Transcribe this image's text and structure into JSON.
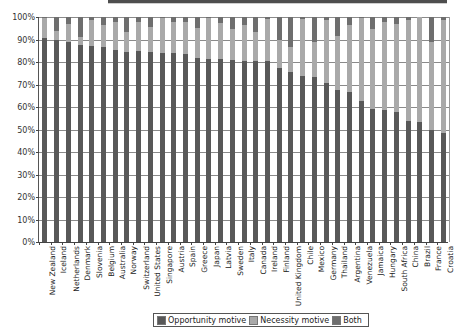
{
  "chart_data": {
    "type": "bar",
    "stacked": true,
    "title": "",
    "xlabel": "",
    "ylabel": "",
    "ylim": [
      0,
      100
    ],
    "y_ticks": [
      "0%",
      "10%",
      "20%",
      "30%",
      "40%",
      "50%",
      "60%",
      "70%",
      "80%",
      "90%",
      "100%"
    ],
    "grid": true,
    "legend_position": "bottom",
    "categories": [
      "New Zealand",
      "Iceland",
      "Netherlands",
      "Denmark",
      "Slovenia",
      "Belgium",
      "Australia",
      "Norway",
      "Switzerland",
      "United States",
      "Singapore",
      "Austria",
      "Spain",
      "Greece",
      "Japan",
      "Latvia",
      "Sweden",
      "Italy",
      "Canada",
      "Ireland",
      "Finland",
      "United Kingdom",
      "Chile",
      "Mexico",
      "Germany",
      "Thailand",
      "Argentina",
      "Venezuela",
      "Jamaica",
      "Hungary",
      "South Africa",
      "China",
      "Brazil",
      "France",
      "Croatia"
    ],
    "series": [
      {
        "name": "Opportunity motive",
        "color": "#585858",
        "values": [
          90.8,
          89.8,
          89.0,
          87.5,
          87.0,
          86.8,
          85.3,
          84.6,
          84.9,
          84.3,
          83.8,
          83.8,
          83.4,
          81.6,
          81.3,
          81.3,
          80.9,
          80.4,
          80.4,
          80.4,
          77.5,
          75.7,
          73.9,
          73.5,
          70.5,
          67.5,
          66.5,
          62.7,
          59.0,
          58.5,
          57.6,
          53.8,
          53.2,
          49.8,
          48.3
        ]
      },
      {
        "name": "Necessity motive",
        "color": "#a9a9a9",
        "values": [
          8.7,
          4.2,
          8.0,
          3.5,
          11.7,
          9.6,
          12.3,
          8.9,
          12.9,
          11.4,
          15.9,
          14.1,
          14.2,
          13.4,
          18.4,
          15.9,
          13.8,
          16.0,
          13.1,
          18.6,
          12.3,
          11.1,
          25.1,
          15.5,
          28.0,
          24.2,
          29.9,
          37.0,
          35.7,
          39.1,
          39.1,
          44.9,
          46.6,
          39.2,
          50.4
        ]
      },
      {
        "name": "Both",
        "color": "#6e6e6e",
        "values": [
          0.5,
          6.0,
          3.0,
          9.0,
          1.3,
          3.6,
          2.4,
          6.5,
          2.2,
          4.3,
          0.3,
          2.1,
          2.4,
          5.0,
          0.3,
          2.8,
          5.3,
          3.6,
          6.5,
          1.0,
          10.2,
          13.2,
          1.0,
          11.0,
          1.5,
          8.3,
          3.6,
          0.3,
          5.3,
          2.4,
          3.3,
          1.3,
          0.2,
          11.0,
          1.3
        ]
      }
    ]
  },
  "legend": {
    "items": [
      {
        "label": "Opportunity motive",
        "color": "#585858"
      },
      {
        "label": "Necessity motive",
        "color": "#a9a9a9"
      },
      {
        "label": "Both",
        "color": "#6e6e6e"
      }
    ]
  }
}
